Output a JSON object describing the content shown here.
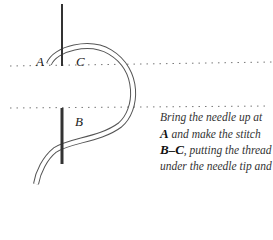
{
  "diagram": {
    "labels": {
      "a": "A",
      "b": "B",
      "c": "C"
    },
    "caption": {
      "line1": "Bring the needle up at",
      "line2_bold": "A",
      "line2_rest": " and make the stitch",
      "line3_bold": "B–C",
      "line3_rest": ", putting the thread",
      "line4": "under the needle tip and"
    }
  }
}
